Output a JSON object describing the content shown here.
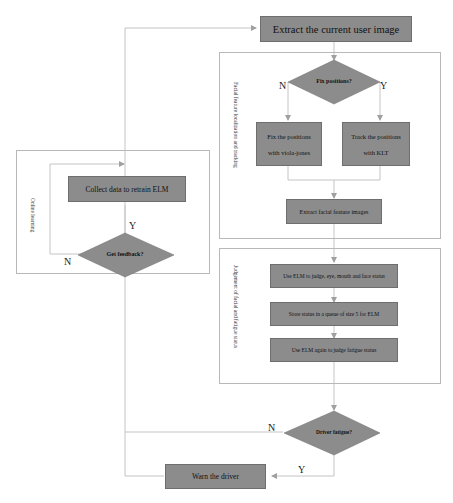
{
  "diagram": {
    "start_box": "Extract the current user image",
    "section_tracking": {
      "label": "Facial feature localization and tracking",
      "decision": "Fix positions?",
      "no_label": "N",
      "yes_label": "Y",
      "left_box": {
        "line1": "Fix the positions",
        "line2": "with viola-jones"
      },
      "right_box": {
        "line1": "Track the positions",
        "line2": "with KLT"
      },
      "extract_box": "Extract facial feature images"
    },
    "section_judgement": {
      "label": "Judgement of facial and fatigue status",
      "step1": "Use ELM to judge, eye, mouth and face status",
      "step2": "Store status in a queue of size 5 for ELM",
      "step3": "Use ELM again to judge fatigue status"
    },
    "section_online": {
      "label": "Online learning",
      "collect_box": "Collect data to retrain ELM",
      "decision": "Get feedback?",
      "yes_label": "Y",
      "no_label": "N"
    },
    "fatigue_decision": "Driver fatigue?",
    "fatigue_no": "N",
    "fatigue_yes": "Y",
    "warn_box": "Warn the driver"
  }
}
